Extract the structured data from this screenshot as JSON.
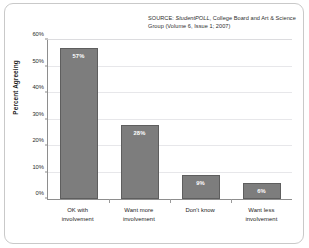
{
  "chart_data": {
    "type": "bar",
    "title": "",
    "subtitle": "",
    "categories": [
      "OK with involvement",
      "Want more involvement",
      "Don't know",
      "Want less involvement"
    ],
    "category_lines": [
      [
        "OK with",
        "involvement"
      ],
      [
        "Want more",
        "involvement"
      ],
      [
        "Don't know",
        ""
      ],
      [
        "Want less",
        "involvement"
      ]
    ],
    "values": [
      57,
      28,
      9,
      6
    ],
    "value_labels": [
      "57%",
      "28%",
      "9%",
      "6%"
    ],
    "xlabel": "",
    "ylabel": "Percent Agreeing",
    "ylim": [
      0,
      60
    ],
    "ytick_values": [
      0,
      10,
      20,
      30,
      40,
      50,
      60
    ],
    "ytick_labels": [
      "0%",
      "10%",
      "20%",
      "30%",
      "40%",
      "50%",
      "60%"
    ],
    "grid": true,
    "legend": "none",
    "bar_color": "#7d7d7d",
    "bar_edge_color": "#5e5e5e",
    "value_label_color": "#ffffff",
    "gridline_color": "#e7e7ea",
    "axis_color": "#8e8e8e",
    "frame_color": "#c9c9c9",
    "background_color": "#ffffff"
  },
  "source_note": {
    "prefix": "SOURCE: ",
    "emphasis": "StudentPOLL",
    "suffix": ", College Board  and Art & Science Group (Volume 6, Issue 1; 2007)"
  }
}
